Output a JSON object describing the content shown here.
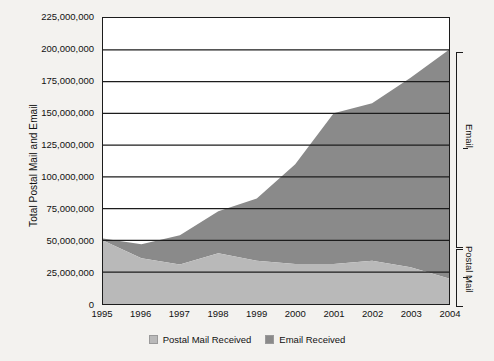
{
  "chart_data": {
    "type": "area",
    "stacked": true,
    "title": "",
    "xlabel": "",
    "ylabel": "Total Postal Mail and Email",
    "categories": [
      "1995",
      "1996",
      "1997",
      "1998",
      "1999",
      "2000",
      "2001",
      "2002",
      "2003",
      "2004"
    ],
    "x": [
      1995,
      1996,
      1997,
      1998,
      1999,
      2000,
      2001,
      2002,
      2003,
      2004
    ],
    "series": [
      {
        "name": "Postal Mail Received",
        "color": "#b9b9b9",
        "values": [
          50000000,
          36000000,
          31000000,
          40000000,
          34000000,
          31500000,
          31500000,
          34000000,
          29000000,
          20000000
        ]
      },
      {
        "name": "Email Received",
        "color": "#8a8a8a",
        "values": [
          1500000,
          11000000,
          23000000,
          33000000,
          49000000,
          78500000,
          118500000,
          124000000,
          149000000,
          180000000
        ]
      }
    ],
    "totals": [
      51500000,
      47000000,
      54000000,
      73000000,
      83000000,
      110000000,
      150000000,
      158000000,
      178000000,
      200000000
    ],
    "ylim": [
      0,
      225000000
    ],
    "ytick_values": [
      0,
      25000000,
      50000000,
      75000000,
      100000000,
      125000000,
      150000000,
      175000000,
      200000000,
      225000000
    ],
    "ytick_labels": [
      "225,000,000",
      "200,000,000",
      "175,000,000",
      "150,000,000",
      "125,000,000",
      "100,000,000",
      "75,000,000",
      "50,000,000",
      "25,000,000",
      "0"
    ],
    "grid": true,
    "grid_axis": "y",
    "legend_position": "bottom",
    "legend_entries": [
      "Postal Mail Received",
      "Email Received"
    ]
  },
  "axes": {
    "y_title": "Total Postal Mail and Email"
  },
  "annotations": {
    "email_bracket_label": "Email",
    "postal_bracket_label": "Postal Mail"
  },
  "legend": {
    "items": [
      {
        "label": "Postal Mail Received",
        "color": "#b9b9b9"
      },
      {
        "label": "Email Received",
        "color": "#8a8a8a"
      }
    ]
  },
  "colors": {
    "postal_mail": "#b9b9b9",
    "email": "#8a8a8a",
    "grid": "#1c1c1c",
    "plot_background": "#ffffff",
    "page_background": "#f3f2ef",
    "text": "#111111"
  }
}
